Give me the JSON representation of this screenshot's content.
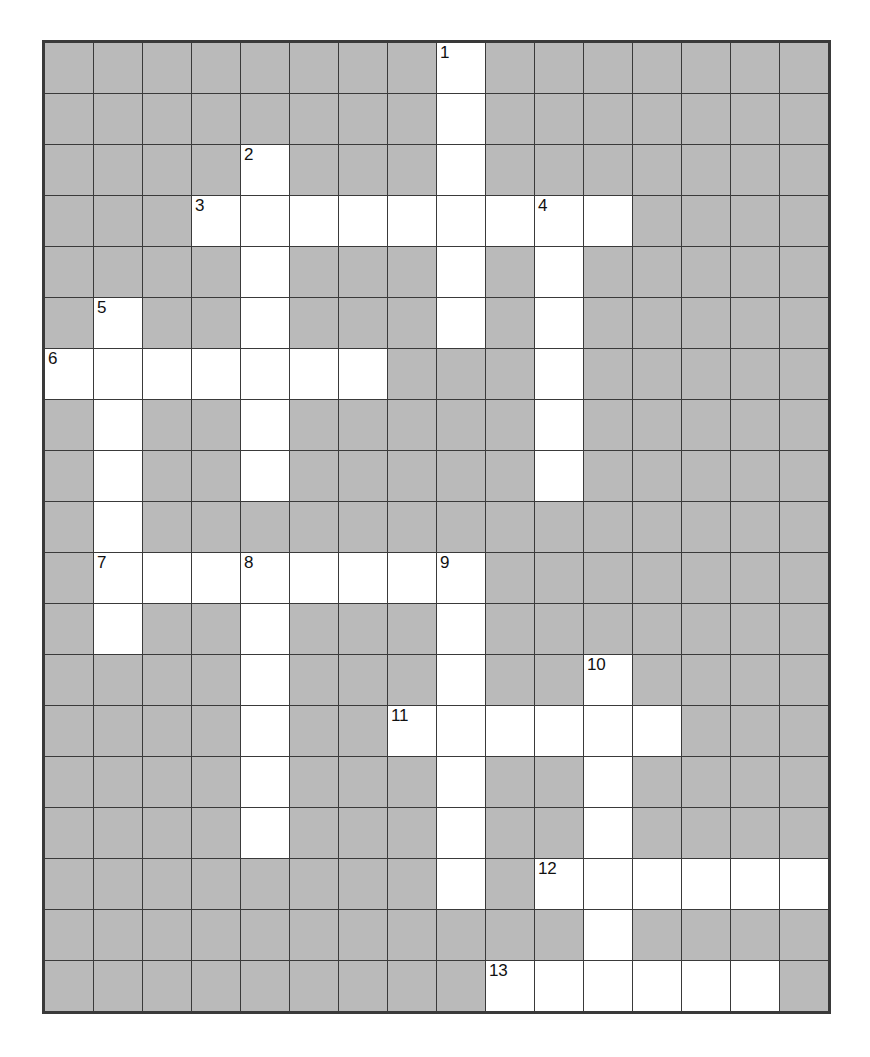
{
  "puzzle": {
    "title": "Crossword Grid",
    "type": "crossword",
    "columns": 16,
    "rows": 19,
    "cell_size_px": 49,
    "colors": {
      "block_fill": "#a8a8a8",
      "open_fill": "#ffffff",
      "grid_line": "#3a3a3a",
      "number_text": "#111111",
      "page_background": "#ffffff"
    },
    "legend": {
      "open_cell": "white fillable square",
      "block_cell": "gray shaded square"
    },
    "clue_numbers": [
      {
        "number": "1",
        "row": 0,
        "col": 8
      },
      {
        "number": "2",
        "row": 2,
        "col": 4
      },
      {
        "number": "3",
        "row": 3,
        "col": 3
      },
      {
        "number": "4",
        "row": 3,
        "col": 10
      },
      {
        "number": "5",
        "row": 5,
        "col": 1
      },
      {
        "number": "6",
        "row": 6,
        "col": 0
      },
      {
        "number": "7",
        "row": 10,
        "col": 1
      },
      {
        "number": "8",
        "row": 10,
        "col": 4
      },
      {
        "number": "9",
        "row": 10,
        "col": 8
      },
      {
        "number": "10",
        "row": 12,
        "col": 11
      },
      {
        "number": "11",
        "row": 13,
        "col": 7
      },
      {
        "number": "12",
        "row": 16,
        "col": 10
      },
      {
        "number": "13",
        "row": 18,
        "col": 9
      }
    ],
    "grid": [
      [
        0,
        0,
        0,
        0,
        0,
        0,
        0,
        0,
        1,
        0,
        0,
        0,
        0,
        0,
        0,
        0
      ],
      [
        0,
        0,
        0,
        0,
        0,
        0,
        0,
        0,
        1,
        0,
        0,
        0,
        0,
        0,
        0,
        0
      ],
      [
        0,
        0,
        0,
        0,
        1,
        0,
        0,
        0,
        1,
        0,
        0,
        0,
        0,
        0,
        0,
        0
      ],
      [
        0,
        0,
        0,
        1,
        1,
        1,
        1,
        1,
        1,
        1,
        1,
        1,
        0,
        0,
        0,
        0
      ],
      [
        0,
        0,
        0,
        0,
        1,
        0,
        0,
        0,
        1,
        0,
        1,
        0,
        0,
        0,
        0,
        0
      ],
      [
        0,
        1,
        0,
        0,
        1,
        0,
        0,
        0,
        1,
        0,
        1,
        0,
        0,
        0,
        0,
        0
      ],
      [
        1,
        1,
        1,
        1,
        1,
        1,
        1,
        0,
        0,
        0,
        1,
        0,
        0,
        0,
        0,
        0
      ],
      [
        0,
        1,
        0,
        0,
        1,
        0,
        0,
        0,
        0,
        0,
        1,
        0,
        0,
        0,
        0,
        0
      ],
      [
        0,
        1,
        0,
        0,
        1,
        0,
        0,
        0,
        0,
        0,
        1,
        0,
        0,
        0,
        0,
        0
      ],
      [
        0,
        1,
        0,
        0,
        0,
        0,
        0,
        0,
        0,
        0,
        0,
        0,
        0,
        0,
        0,
        0
      ],
      [
        0,
        1,
        1,
        1,
        1,
        1,
        1,
        1,
        1,
        0,
        0,
        0,
        0,
        0,
        0,
        0
      ],
      [
        0,
        1,
        0,
        0,
        1,
        0,
        0,
        0,
        1,
        0,
        0,
        0,
        0,
        0,
        0,
        0
      ],
      [
        0,
        0,
        0,
        0,
        1,
        0,
        0,
        0,
        1,
        0,
        0,
        1,
        0,
        0,
        0,
        0
      ],
      [
        0,
        0,
        0,
        0,
        1,
        0,
        0,
        1,
        1,
        1,
        1,
        1,
        1,
        0,
        0,
        0
      ],
      [
        0,
        0,
        0,
        0,
        1,
        0,
        0,
        0,
        1,
        0,
        0,
        1,
        0,
        0,
        0,
        0
      ],
      [
        0,
        0,
        0,
        0,
        1,
        0,
        0,
        0,
        1,
        0,
        0,
        1,
        0,
        0,
        0,
        0
      ],
      [
        0,
        0,
        0,
        0,
        0,
        0,
        0,
        0,
        1,
        0,
        1,
        1,
        1,
        1,
        1,
        1
      ],
      [
        0,
        0,
        0,
        0,
        0,
        0,
        0,
        0,
        0,
        0,
        0,
        1,
        0,
        0,
        0,
        0
      ],
      [
        0,
        0,
        0,
        0,
        0,
        0,
        0,
        0,
        0,
        1,
        1,
        1,
        1,
        1,
        1,
        0
      ]
    ]
  }
}
